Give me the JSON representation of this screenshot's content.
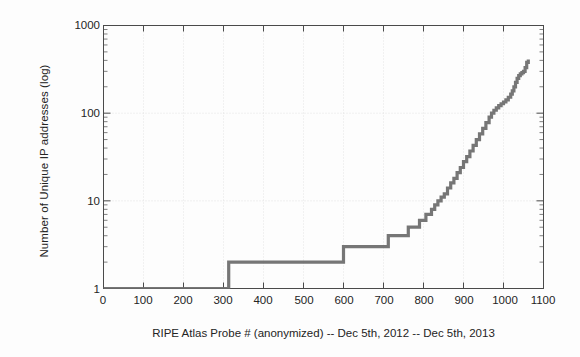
{
  "chart_data": {
    "type": "line",
    "title": "",
    "subtitle": "",
    "xlabel": "RIPE Atlas Probe # (anonymized) -- Dec 5th, 2012 -- Dec 5th, 2013",
    "ylabel": "Number of Unique IP addresses (log)",
    "yscale": "log",
    "xscale": "linear",
    "xlim": [
      0,
      1100
    ],
    "ylim": [
      1,
      1000
    ],
    "xticks": [
      0,
      100,
      200,
      300,
      400,
      500,
      600,
      700,
      800,
      900,
      1000,
      1100
    ],
    "xtick_labels": [
      "0",
      "100",
      "200",
      "300",
      "400",
      "500",
      "600",
      "700",
      "800",
      "900",
      "1000",
      "1100"
    ],
    "yticks": [
      1,
      10,
      100,
      1000
    ],
    "ytick_labels": [
      "1",
      "10",
      "100",
      "1000"
    ],
    "grid": true,
    "legend": null,
    "series": [
      {
        "name": "Unique IP addresses per probe (sorted)",
        "color": "#6a6a6a",
        "marker": "point",
        "linewidth": 1,
        "x": [
          0,
          40,
          80,
          120,
          160,
          200,
          240,
          280,
          310,
          313,
          320,
          360,
          400,
          440,
          480,
          520,
          560,
          596,
          600,
          610,
          640,
          670,
          700,
          708,
          712,
          730,
          750,
          758,
          762,
          775,
          790,
          800,
          806,
          812,
          820,
          828,
          836,
          844,
          852,
          860,
          868,
          876,
          884,
          892,
          900,
          908,
          916,
          924,
          932,
          940,
          948,
          956,
          964,
          970,
          976,
          982,
          988,
          994,
          1000,
          1006,
          1012,
          1018,
          1022,
          1026,
          1030,
          1034,
          1038,
          1042,
          1046,
          1050,
          1054,
          1058,
          1062
        ],
        "y": [
          1,
          1,
          1,
          1,
          1,
          1,
          1,
          1,
          1,
          2,
          2,
          2,
          2,
          2,
          2,
          2,
          2,
          2,
          3,
          3,
          3,
          3,
          3,
          3,
          4,
          4,
          4,
          4,
          5,
          5,
          6,
          6,
          7,
          7,
          8,
          9,
          10,
          11,
          12,
          14,
          16,
          18,
          21,
          24,
          28,
          32,
          37,
          43,
          50,
          58,
          67,
          78,
          90,
          100,
          108,
          115,
          122,
          128,
          134,
          142,
          152,
          165,
          180,
          200,
          225,
          250,
          268,
          280,
          290,
          300,
          330,
          380,
          410
        ]
      }
    ]
  },
  "axes": {
    "y_label_text": "Number of Unique IP addresses (log)",
    "x_label_text": "RIPE Atlas Probe # (anonymized) -- Dec 5th, 2012 -- Dec 5th, 2013"
  },
  "colors": {
    "data": "#6a6a6a",
    "axis": "#4a4a4a",
    "grid": "#dedede",
    "text": "#242424",
    "background": "#fdfdfd"
  }
}
